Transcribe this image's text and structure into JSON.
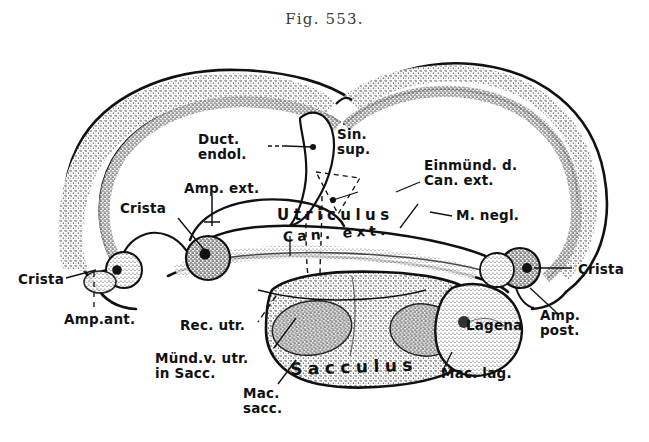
{
  "figure": {
    "title": "Fig. 553.",
    "style": "stippled pen-and-ink line drawing, black on white"
  },
  "colors": {
    "ink": "#111111",
    "stipple": "#2b2b2b",
    "background": "#ffffff",
    "title_ink": "#3a3a3a"
  },
  "labels": {
    "duct_endol": "Duct.\nendol.",
    "sin_sup": "Sin.\nsup.",
    "einmund": "Einmünd. d.\nCan. ext.",
    "amp_ext": "Amp. ext.",
    "crista_left_inner": "Crista",
    "utriculus": "Utriculus",
    "can_ext": "Can. ext.",
    "m_negl": "M. negl.",
    "crista_far_left": "Crista",
    "amp_ant": "Amp.ant.",
    "crista_far_right": "Crista",
    "amp_post": "Amp.\npost.",
    "rec_utr": "Rec. utr.",
    "mund_v_utr": "Münd.v. utr.\nin Sacc.",
    "mac_sacc": "Mac.\nsacc.",
    "sacculus": "Sacculus",
    "lagena": "Lagena",
    "mac_lag": "Mac. lag."
  },
  "structures": [
    {
      "name": "canalis-anterior-loop",
      "side": "left"
    },
    {
      "name": "canalis-posterior-loop",
      "side": "right"
    },
    {
      "name": "ductus-endolymphaticus",
      "side": "center-top"
    },
    {
      "name": "utriculus",
      "side": "center"
    },
    {
      "name": "canalis-externus",
      "side": "center"
    },
    {
      "name": "sacculus",
      "side": "center-bottom"
    },
    {
      "name": "lagena",
      "side": "right-bottom"
    },
    {
      "name": "ampulla-anterior",
      "side": "far-left"
    },
    {
      "name": "ampulla-externa",
      "side": "left-center"
    },
    {
      "name": "ampulla-posterior",
      "side": "far-right"
    },
    {
      "name": "macula-sacculi",
      "side": "center-bottom"
    },
    {
      "name": "macula-lagenae",
      "side": "right-bottom"
    },
    {
      "name": "macula-neglecta",
      "side": "right-center"
    }
  ]
}
